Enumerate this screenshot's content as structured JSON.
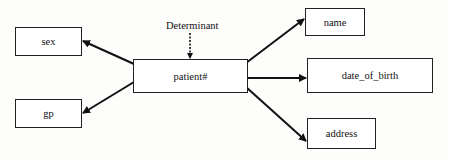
{
  "diagram": {
    "type": "functional-dependency",
    "determinant_label": "Determinant",
    "center": {
      "id": "patient",
      "label": "patient#"
    },
    "attributes": [
      {
        "id": "sex",
        "label": "sex",
        "side": "left"
      },
      {
        "id": "gp",
        "label": "gp",
        "side": "left"
      },
      {
        "id": "name",
        "label": "name",
        "side": "right"
      },
      {
        "id": "date_of_birth",
        "label": "date_of_birth",
        "side": "right"
      },
      {
        "id": "address",
        "label": "address",
        "side": "right"
      }
    ],
    "edges": [
      {
        "from": "patient",
        "to": "sex"
      },
      {
        "from": "patient",
        "to": "gp"
      },
      {
        "from": "patient",
        "to": "name"
      },
      {
        "from": "patient",
        "to": "date_of_birth"
      },
      {
        "from": "patient",
        "to": "address"
      },
      {
        "from": "determinant_label",
        "to": "patient",
        "style": "dashed"
      }
    ],
    "colors": {
      "line": "#111111",
      "box_border": "#222222",
      "background": "#fdfdfb"
    }
  }
}
